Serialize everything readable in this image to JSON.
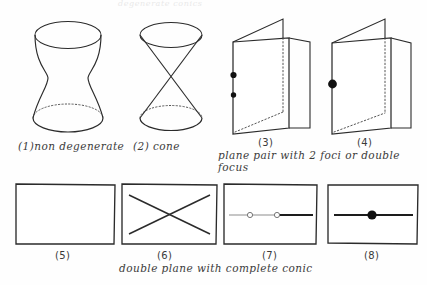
{
  "page": {
    "width": 427,
    "height": 285,
    "background_color": "#fefefe",
    "ink_color": "#2b2b2b",
    "top_cropped_text": "degenerate conics"
  },
  "figures": [
    {
      "id": "fig-1",
      "number_label": "(1)non degenerate",
      "name": "hyperboloid-of-one-sheet",
      "description": "non degenerate quadric surface drawn as a hyperboloid of one sheet with top ellipse and bottom ellipse, hidden back arcs dotted"
    },
    {
      "id": "fig-2",
      "number_label": "(2) cone",
      "name": "double-cone",
      "description": "degenerate quadric drawn as a double cone with two nappes meeting at a vertex, top ellipse solid and bottom ellipse with dotted back arc"
    },
    {
      "id": "fig-3",
      "number_label": "(3)",
      "name": "plane-pair-two-foci",
      "description": "folded plane pair shown as two planes hinged like an open book, with two small filled dots marking two foci on the left edge; hidden fold edges dotted"
    },
    {
      "id": "fig-4",
      "number_label": "(4)",
      "name": "plane-pair-double-focus",
      "description": "folded plane pair shown as two planes hinged like an open book, with one larger filled dot marking a double focus on the left edge; hidden fold edges dotted"
    },
    {
      "id": "fig-5",
      "number_label": "(5)",
      "name": "empty-plane-rectangle",
      "description": "plain rectangle representing a double plane with no visible conic"
    },
    {
      "id": "fig-6",
      "number_label": "(6)",
      "name": "plane-with-crossing-lines",
      "description": "rectangle containing two crossing diagonal lines forming an X"
    },
    {
      "id": "fig-7",
      "number_label": "(7)",
      "name": "plane-with-line-and-two-foci",
      "description": "rectangle containing a horizontal line with two small open circles marking two foci"
    },
    {
      "id": "fig-8",
      "number_label": "(8)",
      "name": "plane-with-line-and-double-focus",
      "description": "rectangle containing a horizontal line with one large filled dot marking a double focus"
    }
  ],
  "captions": {
    "plane_pair": {
      "line1": "plane pair with 2 foci or double",
      "line2": "focus"
    },
    "double_plane": {
      "line1": "double plane with complete conic"
    }
  }
}
